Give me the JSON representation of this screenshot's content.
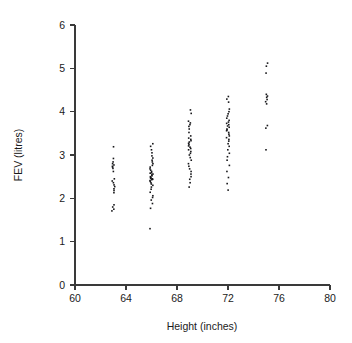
{
  "figure": {
    "title": "",
    "background_color": "#ffffff",
    "ink_color": "#17171a"
  },
  "axes": {
    "x_title": "Height (inches)",
    "y_title": "FEV (litres)",
    "x_ticks": [
      "60",
      "64",
      "68",
      "72",
      "76",
      "80"
    ],
    "y_ticks": [
      "0",
      "1",
      "2",
      "3",
      "4",
      "5",
      "6"
    ]
  },
  "chart_data": {
    "type": "scatter",
    "title": "",
    "xlabel": "Height (inches)",
    "ylabel": "FEV (litres)",
    "xlim": [
      60,
      80
    ],
    "ylim": [
      0,
      6
    ],
    "xticks": [
      60,
      64,
      68,
      72,
      76,
      80
    ],
    "yticks": [
      0,
      1,
      2,
      3,
      4,
      5,
      6
    ],
    "grid": false,
    "legend": false,
    "marker": "square",
    "marker_size": 1.6,
    "groups": [
      {
        "x": 63,
        "n": 21,
        "y": [
          3.19,
          2.92,
          2.84,
          2.8,
          2.77,
          2.74,
          2.72,
          2.69,
          2.45,
          2.4,
          2.36,
          2.31,
          2.27,
          2.22,
          2.18,
          2.13,
          1.85,
          1.8,
          1.75,
          1.71,
          2.62
        ]
      },
      {
        "x": 66,
        "n": 40,
        "y": [
          3.26,
          3.2,
          3.12,
          3.05,
          2.98,
          2.93,
          2.88,
          2.84,
          2.8,
          2.76,
          2.72,
          2.68,
          2.65,
          2.62,
          2.59,
          2.56,
          2.54,
          2.52,
          2.5,
          2.48,
          2.47,
          2.46,
          2.45,
          2.44,
          2.43,
          2.41,
          2.39,
          2.36,
          2.33,
          2.3,
          2.26,
          2.21,
          2.14,
          2.06,
          2.02,
          1.96,
          1.88,
          1.77,
          1.3,
          2.58
        ]
      },
      {
        "x": 69,
        "n": 33,
        "y": [
          4.04,
          3.96,
          3.78,
          3.74,
          3.7,
          3.66,
          3.6,
          3.52,
          3.44,
          3.39,
          3.36,
          3.33,
          3.3,
          3.27,
          3.24,
          3.21,
          3.18,
          3.15,
          3.12,
          3.08,
          3.04,
          3.0,
          2.94,
          2.88,
          2.8,
          2.74,
          2.68,
          2.62,
          2.56,
          2.5,
          2.44,
          2.36,
          2.26
        ]
      },
      {
        "x": 72,
        "n": 34,
        "y": [
          4.35,
          4.29,
          4.22,
          4.06,
          4.0,
          3.95,
          3.9,
          3.85,
          3.8,
          3.76,
          3.73,
          3.7,
          3.67,
          3.64,
          3.6,
          3.56,
          3.52,
          3.48,
          3.44,
          3.4,
          3.36,
          3.32,
          3.26,
          3.2,
          3.12,
          3.04,
          2.96,
          2.88,
          2.76,
          2.62,
          2.48,
          2.34,
          2.19,
          3.58
        ]
      },
      {
        "x": 75,
        "n": 12,
        "y": [
          5.12,
          5.05,
          4.89,
          4.4,
          4.33,
          4.28,
          4.23,
          4.18,
          3.68,
          3.62,
          3.12,
          4.36
        ]
      }
    ]
  }
}
